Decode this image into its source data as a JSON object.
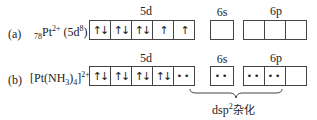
{
  "rows": [
    {
      "id": "a",
      "label": "(a)",
      "species_prefix_sub": "78",
      "species": "Pt",
      "species_sup": "2+",
      "config_open": "(5d",
      "config_sup": "8",
      "config_close": ")",
      "orbitals": {
        "5d": [
          "↑↓",
          "↑↓",
          "↑↓",
          "↑",
          "↑"
        ],
        "6s": [
          ""
        ],
        "6p": [
          "",
          "",
          ""
        ]
      }
    },
    {
      "id": "b",
      "label": "(b)",
      "species_open": "[Pt(NH",
      "species_sub": "3",
      "species_mid": ")",
      "species_sub2": "4",
      "species_close": "]",
      "species_sup": "2+",
      "orbitals": {
        "5d": [
          "↑↓",
          "↑↓",
          "↑↓",
          "↑↓",
          "••"
        ],
        "6s": [
          "••"
        ],
        "6p": [
          "••",
          "••",
          ""
        ]
      }
    }
  ],
  "orbital_labels": {
    "d": "5d",
    "s": "6s",
    "p": "6p"
  },
  "hybrid_label": {
    "text": "dsp",
    "sup": "2",
    "suffix": "杂化"
  }
}
